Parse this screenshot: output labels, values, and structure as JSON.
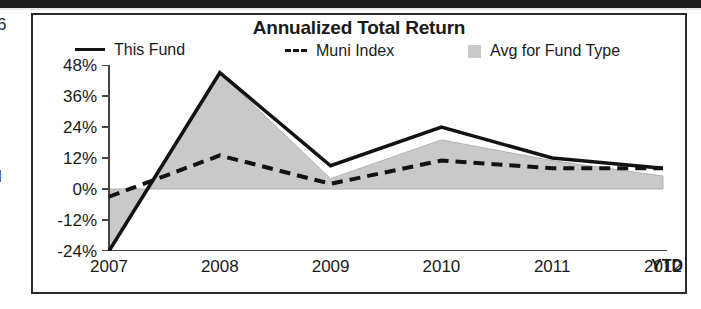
{
  "chart_data": {
    "type": "line",
    "title": "Annualized Total Return",
    "xlabel": "",
    "ylabel": "",
    "x": [
      "2007",
      "2008",
      "2009",
      "2010",
      "2011",
      "2012"
    ],
    "categories": [
      "2007",
      "2008",
      "2009",
      "2010",
      "2011",
      "2012"
    ],
    "x_tick_labels": [
      "2007",
      "2008",
      "2009",
      "2010",
      "2011",
      "2012"
    ],
    "x_axis_suffix": "YTD",
    "y_tick_labels": [
      "48%",
      "36%",
      "24%",
      "12%",
      "0%",
      "-12%",
      "-24%"
    ],
    "y_tick_values": [
      48,
      36,
      24,
      12,
      0,
      -12,
      -24
    ],
    "ylim": [
      -24,
      48
    ],
    "grid": false,
    "legend_position": "top",
    "series": [
      {
        "name": "This Fund",
        "style": "solid",
        "color": "#121212",
        "values": [
          -24,
          45,
          9,
          24,
          12,
          8
        ]
      },
      {
        "name": "Muni Index",
        "style": "dashed",
        "color": "#121212",
        "values": [
          -3,
          13,
          2,
          11,
          8,
          8
        ]
      },
      {
        "name": "Avg for Fund Type",
        "style": "area",
        "color": "#c9c9c9",
        "values": [
          -24,
          45,
          4,
          19,
          11,
          5
        ]
      }
    ]
  },
  "chart": {
    "title": "Annualized Total Return",
    "legend": [
      {
        "label": "This Fund",
        "key": "solid-line-key"
      },
      {
        "label": "Muni Index",
        "key": "dashed-line-key"
      },
      {
        "label": "Avg for Fund Type",
        "key": "gray-swatch-key"
      }
    ],
    "y_axis": {
      "ticks": [
        "48%",
        "36%",
        "24%",
        "12%",
        "0%",
        "-12%",
        "-24%"
      ]
    },
    "x_axis": {
      "ticks": [
        "2007",
        "2008",
        "2009",
        "2010",
        "2011",
        "2012"
      ],
      "suffix": "YTD"
    },
    "colors": {
      "line": "#121212",
      "area_fill": "#c9c9c9",
      "frame": "#2b2b2b",
      "background": "#ffffff"
    }
  },
  "scan_artifacts": {
    "left_top_fragment": "6",
    "left_mid_fragment": "l"
  }
}
